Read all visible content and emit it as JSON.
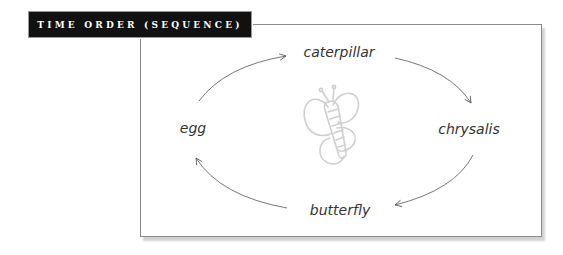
{
  "header": {
    "title": "TIME ORDER (SEQUENCE)"
  },
  "diagram": {
    "type": "cycle",
    "center_icon": "butterfly-icon",
    "nodes": [
      {
        "id": "caterpillar",
        "label": "caterpillar"
      },
      {
        "id": "chrysalis",
        "label": "chrysalis"
      },
      {
        "id": "butterfly",
        "label": "butterfly"
      },
      {
        "id": "egg",
        "label": "egg"
      }
    ],
    "edges": [
      {
        "from": "egg",
        "to": "caterpillar"
      },
      {
        "from": "caterpillar",
        "to": "chrysalis"
      },
      {
        "from": "chrysalis",
        "to": "butterfly"
      },
      {
        "from": "butterfly",
        "to": "egg"
      }
    ],
    "colors": {
      "title_bg": "#111111",
      "title_text": "#ffffff",
      "frame_border": "#8a8a8a",
      "arrow": "#555555",
      "icon": "#cfcfcf"
    }
  }
}
